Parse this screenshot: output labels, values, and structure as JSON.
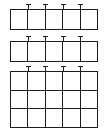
{
  "figure": {
    "canvas_width": 107,
    "canvas_height": 136,
    "background_color": "#ffffff",
    "line_color": "#1d1d1d"
  },
  "chart_data": {
    "type": "table",
    "title": "",
    "blocks": [
      {
        "id": "grid-block-1",
        "label": "Top grid",
        "columns": 5,
        "rows": 1,
        "x": 10,
        "y": 9,
        "width": 88,
        "height": 21,
        "tick_count": 4,
        "cells": [
          [
            "",
            "",
            "",
            "",
            ""
          ]
        ]
      },
      {
        "id": "grid-block-2",
        "label": "Middle grid",
        "columns": 5,
        "rows": 1,
        "x": 10,
        "y": 41,
        "width": 88,
        "height": 21,
        "tick_count": 4,
        "cells": [
          [
            "",
            "",
            "",
            "",
            ""
          ]
        ]
      },
      {
        "id": "grid-block-3",
        "label": "Bottom grid",
        "columns": 5,
        "rows": 3,
        "x": 10,
        "y": 71,
        "width": 88,
        "height": 57,
        "tick_count": 4,
        "cells": [
          [
            "",
            "",
            "",
            "",
            ""
          ],
          [
            "",
            "",
            "",
            "",
            ""
          ],
          [
            "",
            "",
            "",
            "",
            ""
          ]
        ]
      }
    ]
  }
}
